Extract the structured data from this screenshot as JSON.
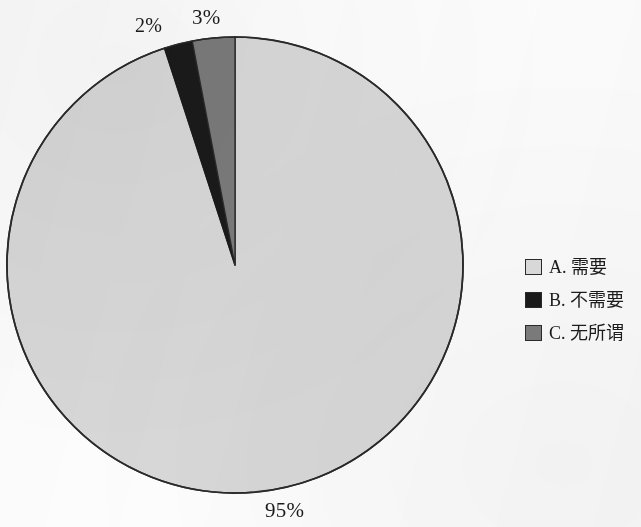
{
  "chart_data": {
    "type": "pie",
    "title": "",
    "subtitle": "",
    "xlabel": "",
    "ylabel": "",
    "grid": false,
    "legend_position": "right",
    "start_angle_deg": 0,
    "direction": "clockwise",
    "categories": [
      "A. 需要",
      "B. 不需要",
      "C. 无所谓"
    ],
    "values": [
      95,
      2,
      3
    ],
    "value_labels": [
      "95%",
      "2%",
      "3%"
    ],
    "slice_colors": [
      "#d8d8d8",
      "#1a1a1a",
      "#7a7a7a"
    ],
    "slices": [
      {
        "key": "A",
        "label": "A. 需要",
        "option_letter": "A.",
        "option_text": "需要",
        "value": 95,
        "value_label": "95%",
        "color": "#d8d8d8",
        "start_deg": 0,
        "end_deg": 342
      },
      {
        "key": "B",
        "label": "B. 不需要",
        "option_letter": "B.",
        "option_text": "不需要",
        "value": 2,
        "value_label": "2%",
        "color": "#1a1a1a",
        "start_deg": 342,
        "end_deg": 349.2
      },
      {
        "key": "C",
        "label": "C. 无所谓",
        "option_letter": "C.",
        "option_text": "无所谓",
        "value": 3,
        "value_label": "3%",
        "color": "#7a7a7a",
        "start_deg": 349.2,
        "end_deg": 360
      }
    ]
  },
  "pie": {
    "outline_color": "#2b2b2b",
    "center_x": 235,
    "center_y": 265,
    "radius": 228
  },
  "labels": {
    "a_pct": "95%",
    "b_pct": "2%",
    "c_pct": "3%"
  },
  "legend": {
    "items": [
      {
        "label": "A. 需要",
        "color": "#d8d8d8"
      },
      {
        "label": "B. 不需要",
        "color": "#1a1a1a"
      },
      {
        "label": "C. 无所谓",
        "color": "#7a7a7a"
      }
    ]
  },
  "page": {
    "background": "#fdfdfd"
  }
}
